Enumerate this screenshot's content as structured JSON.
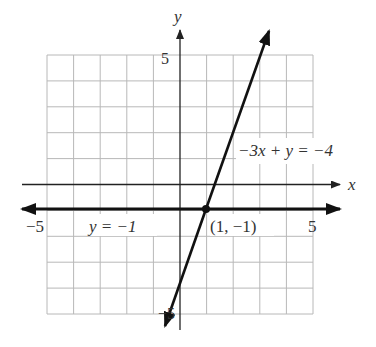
{
  "graph": {
    "x_axis_label": "x",
    "y_axis_label": "y",
    "tick_labels": {
      "x_min": "−5",
      "x_max": "5",
      "y_max": "5",
      "y_min": "−5"
    },
    "grid": {
      "x_range": [
        -5,
        5
      ],
      "y_range": [
        -5,
        5
      ],
      "step": 1
    },
    "lines": [
      {
        "equation_label": "−3x + y = −4",
        "slope": 3,
        "intercept": -4
      },
      {
        "equation_label": "y = −1",
        "slope": 0,
        "intercept": -1
      }
    ],
    "intersection": {
      "label": "(1, −1)",
      "x": 1,
      "y": -1
    },
    "colors": {
      "grid": "#b8b8b8",
      "axis": "#222222",
      "line": "#111111"
    }
  }
}
